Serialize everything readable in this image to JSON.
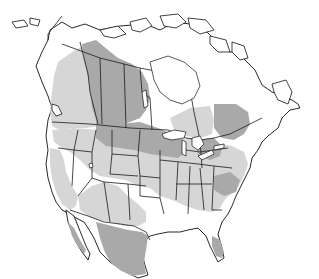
{
  "map": {
    "subject": "North America species range map",
    "region": "North America (Canada, United States, northern Mexico)",
    "legend_tones": [
      {
        "name": "range-dark",
        "color": "#a9a9a9"
      },
      {
        "name": "range-light",
        "color": "#d6d6d6"
      },
      {
        "name": "outside-range",
        "color": "#ffffff"
      }
    ],
    "border_color": "#1a1a1a",
    "background_color": "#ffffff"
  }
}
